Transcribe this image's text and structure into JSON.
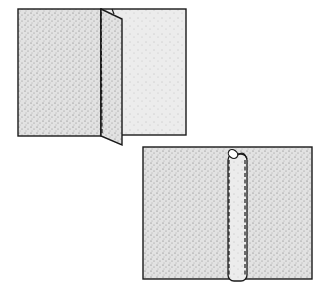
{
  "diagram": {
    "colors": {
      "fabric": "#e4e4e4",
      "stipple": "#6a6a6a",
      "outline": "#1a1a1a",
      "background": "#ffffff"
    },
    "panels": [
      {
        "id": "step-1",
        "label": "",
        "shape": "plain seam with folded seam allowance flap"
      },
      {
        "id": "step-2",
        "label": "",
        "shape": "seam with rolled tube stitched on both sides"
      }
    ]
  }
}
